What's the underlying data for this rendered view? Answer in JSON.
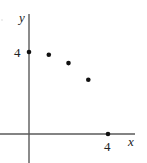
{
  "chart_data": {
    "type": "scatter",
    "title": "",
    "xlabel": "x",
    "ylabel": "y",
    "x_tick_labels": [
      "4"
    ],
    "y_tick_labels": [
      "4"
    ],
    "xlim": [
      -1.45,
      5.35
    ],
    "ylim": [
      -1.45,
      5.85
    ],
    "grid": false,
    "legend": null,
    "points": [
      {
        "x": 0,
        "y": 4
      },
      {
        "x": 1,
        "y": 3.87
      },
      {
        "x": 2,
        "y": 3.46
      },
      {
        "x": 3,
        "y": 2.65
      },
      {
        "x": 4,
        "y": 0
      }
    ],
    "x": [
      0,
      1,
      2,
      3,
      4
    ],
    "values": [
      4,
      3.87,
      3.46,
      3.65,
      0
    ],
    "annotations": []
  },
  "labels": {
    "x_axis": "x",
    "y_axis": "y",
    "x_tick": "4",
    "y_tick": "4"
  },
  "colors": {
    "axis": "#5a5a5a",
    "point": "#111111",
    "text": "#222222"
  }
}
